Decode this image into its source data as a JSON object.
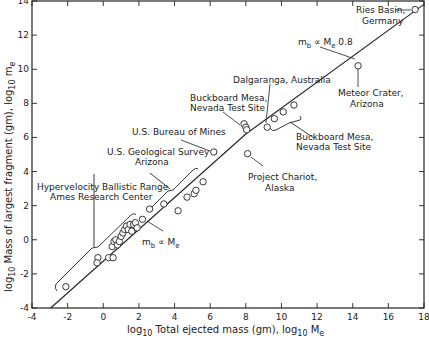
{
  "chart_data": {
    "type": "scatter",
    "title": "",
    "xlabel": "log10 Total ejected mass (gm), log10 Me",
    "ylabel": "log10 Mass of largest fragment (gm), log10 me",
    "xlim": [
      -4,
      18
    ],
    "ylim": [
      -4,
      14
    ],
    "x_ticks": [
      -4,
      -2,
      0,
      2,
      4,
      6,
      8,
      10,
      12,
      14,
      16,
      18
    ],
    "y_ticks": [
      -4,
      -2,
      0,
      2,
      4,
      6,
      8,
      10,
      12,
      14
    ],
    "grid": false,
    "lines": [
      {
        "name": "mb ∝ Me (lower fit)",
        "x": [
          -2.95,
          8.0
        ],
        "y": [
          -4.0,
          6.2
        ]
      },
      {
        "name": "mb ∝ Me 0.8",
        "x": [
          8.0,
          18.0
        ],
        "y": [
          6.2,
          13.8
        ]
      }
    ],
    "series": [
      {
        "name": "Hypervelocity Ballistic Range, Ames Research Center",
        "points": [
          [
            -2.1,
            -2.75
          ],
          [
            -0.3,
            -1.05
          ],
          [
            -0.35,
            -1.35
          ],
          [
            0.3,
            -1.05
          ],
          [
            0.55,
            -1.05
          ],
          [
            0.5,
            -0.4
          ],
          [
            0.6,
            -0.1
          ],
          [
            0.7,
            0.0
          ],
          [
            0.8,
            -0.3
          ],
          [
            0.9,
            -0.1
          ],
          [
            1.0,
            0.2
          ],
          [
            1.1,
            0.4
          ],
          [
            1.2,
            0.6
          ],
          [
            1.3,
            0.8
          ],
          [
            1.4,
            0.6
          ],
          [
            1.5,
            0.9
          ],
          [
            1.6,
            0.5
          ],
          [
            1.7,
            0.9
          ],
          [
            1.8,
            1.0
          ],
          [
            1.9,
            0.7
          ],
          [
            2.2,
            1.2
          ]
        ]
      },
      {
        "name": "U.S. Geological Survey Arizona",
        "points": [
          [
            2.6,
            1.8
          ],
          [
            3.4,
            2.1
          ],
          [
            4.2,
            1.7
          ],
          [
            4.7,
            2.5
          ],
          [
            5.1,
            2.7
          ],
          [
            5.2,
            2.9
          ],
          [
            5.6,
            3.4
          ]
        ]
      },
      {
        "name": "U.S. Bureau of Mines",
        "points": [
          [
            6.2,
            5.15
          ]
        ]
      },
      {
        "name": "Buckboard Mesa, Nevada Test Site (1)",
        "points": [
          [
            7.9,
            6.8
          ],
          [
            8.0,
            6.6
          ],
          [
            8.05,
            6.45
          ]
        ]
      },
      {
        "name": "Project Chariot, Alaska",
        "points": [
          [
            8.1,
            5.05
          ]
        ]
      },
      {
        "name": "Dalgaranga, Australia",
        "points": [
          [
            9.2,
            6.6
          ]
        ]
      },
      {
        "name": "Buckboard Mesa, Nevada Test Site (2)",
        "points": [
          [
            9.6,
            7.1
          ],
          [
            10.1,
            7.5
          ],
          [
            10.7,
            7.9
          ]
        ]
      },
      {
        "name": "Meteor Crater, Arizona",
        "points": [
          [
            14.3,
            10.2
          ]
        ]
      },
      {
        "name": "Ries Basin, Germany",
        "points": [
          [
            17.5,
            13.5
          ]
        ]
      }
    ],
    "annotations": [
      "Ries Basin, Germany",
      "mb ∝ Me 0.8",
      "Meteor Crater, Arizona",
      "Dalgaranga, Australia",
      "Buckboard Mesa, Nevada Test Site",
      "U.S. Bureau of Mines",
      "U.S. Geological Survey Arizona",
      "Project Chariot, Alaska",
      "Hypervelocity Ballistic Range Ames Research Center",
      "mb ∝ Me"
    ]
  },
  "labels": {
    "ries_1": "Ries Basin,",
    "ries_2": "Germany",
    "fit_upper_a": "m",
    "fit_upper_sub": "b",
    "fit_upper_b": " ∝ M",
    "fit_upper_sub2": "e",
    "fit_upper_exp": " 0.8",
    "meteor_1": "Meteor Crater,",
    "meteor_2": "Arizona",
    "dalgaranga": "Dalgaranga, Australia",
    "buckboard1_1": "Buckboard Mesa,",
    "buckboard1_2": "Nevada Test Site",
    "buckboard2_1": "Buckboard Mesa,",
    "buckboard2_2": "Nevada Test Site",
    "bureau": "U.S. Bureau of Mines",
    "usgs_1": "U.S. Geological Survey",
    "usgs_2": "Arizona",
    "chariot_1": "Project Chariot,",
    "chariot_2": "Alaska",
    "ames_1": "Hypervelocity Ballistic Range",
    "ames_2": "Ames Research Center",
    "fit_lower_a": "m",
    "fit_lower_sub": "b",
    "fit_lower_b": " ∝ M",
    "fit_lower_sub2": "e",
    "xlabel_a": "log",
    "xlabel_sub": "10",
    "xlabel_b": " Total ejected mass (gm), log",
    "xlabel_sub2": "10",
    "xlabel_c": " M",
    "xlabel_sub3": "e",
    "ylabel_a": "log",
    "ylabel_sub": "10",
    "ylabel_b": " Mass of largest fragment (gm), log",
    "ylabel_sub2": "10",
    "ylabel_c": " m",
    "ylabel_sub3": "e"
  }
}
